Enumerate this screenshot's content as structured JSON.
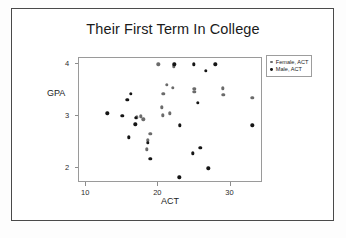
{
  "chart_data": {
    "type": "scatter",
    "title": "Their First Term In College",
    "xlabel": "ACT",
    "ylabel": "GPA",
    "xlim": [
      9,
      34.5
    ],
    "ylim": [
      1.72,
      4.12
    ],
    "xticks": [
      10,
      20,
      30
    ],
    "xticklabels": [
      "10",
      "20",
      "30"
    ],
    "yticks": [
      2,
      3,
      4
    ],
    "yticklabels": [
      "2",
      "3",
      "4"
    ],
    "grid": false,
    "legend_position": "outside right top",
    "series": [
      {
        "name": "Female, ACT",
        "color": "#6b6b6b",
        "marker": "circle",
        "points": [
          [
            20.0,
            4.0
          ],
          [
            22.1,
            3.96
          ],
          [
            21.2,
            3.6
          ],
          [
            22.0,
            3.55
          ],
          [
            20.7,
            3.43
          ],
          [
            20.5,
            3.17
          ],
          [
            20.6,
            3.02
          ],
          [
            21.6,
            3.06
          ],
          [
            17.0,
            2.98
          ],
          [
            17.6,
            3.0
          ],
          [
            17.9,
            2.94
          ],
          [
            18.9,
            2.67
          ],
          [
            18.5,
            2.54
          ],
          [
            18.4,
            2.37
          ],
          [
            25.0,
            3.53
          ],
          [
            25.0,
            3.47
          ],
          [
            28.9,
            3.54
          ],
          [
            29.0,
            3.41
          ],
          [
            33.0,
            3.35
          ]
        ]
      },
      {
        "name": "Male, ACT",
        "color": "#151515",
        "marker": "circle",
        "points": [
          [
            22.2,
            4.0
          ],
          [
            24.9,
            4.0
          ],
          [
            27.9,
            4.0
          ],
          [
            26.6,
            3.87
          ],
          [
            16.2,
            3.43
          ],
          [
            15.7,
            3.32
          ],
          [
            12.9,
            3.06
          ],
          [
            15.0,
            3.01
          ],
          [
            16.9,
            2.97
          ],
          [
            16.8,
            2.85
          ],
          [
            15.9,
            2.6
          ],
          [
            18.5,
            2.49
          ],
          [
            18.9,
            2.19
          ],
          [
            23.0,
            2.83
          ],
          [
            25.5,
            3.26
          ],
          [
            25.8,
            2.4
          ],
          [
            24.8,
            2.29
          ],
          [
            26.9,
            2.0
          ],
          [
            22.9,
            1.83
          ],
          [
            33.0,
            2.83
          ]
        ]
      }
    ]
  }
}
